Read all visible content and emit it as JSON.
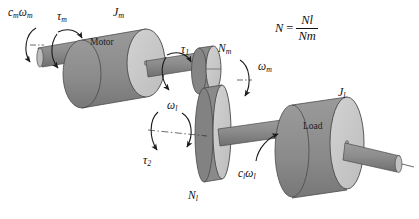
{
  "figure": {
    "background": "#ffffff",
    "stroke": "#1a1a1a"
  },
  "colors": {
    "body_dark": "#8f8f8f",
    "body_shade": "#7e7e7e",
    "face_light": "#c6c6c6",
    "shaft": "#949494",
    "shaft_dark": "#7d7d7d",
    "outline": "#3a3a3a",
    "text": "#111111"
  },
  "parts": {
    "motor": {
      "label": "Motor",
      "inertia": "J",
      "inertia_sub": "m"
    },
    "load": {
      "label": "Load",
      "inertia": "J",
      "inertia_sub": "l"
    },
    "gear_motor": {
      "label": "N",
      "label_sub": "m"
    },
    "gear_load": {
      "label": "N",
      "label_sub": "l"
    }
  },
  "annotations": [
    {
      "name": "motor-damping",
      "text": "c",
      "sub1": "m",
      "text2": "ω",
      "sub2": "m"
    },
    {
      "name": "motor-torque",
      "text": "τ",
      "sub1": "m"
    },
    {
      "name": "gear-torque-1",
      "text": "τ",
      "sub1": "1"
    },
    {
      "name": "gear-torque-2",
      "text": "τ",
      "sub1": "2"
    },
    {
      "name": "motor-speed",
      "text": "ω",
      "sub1": "m"
    },
    {
      "name": "load-speed",
      "text": "ω",
      "sub1": "l"
    },
    {
      "name": "load-damping",
      "text": "c",
      "sub1": "l",
      "text2": "ω",
      "sub2": "l"
    }
  ],
  "labels": {
    "motor_name": "Motor",
    "load_name": "Load",
    "Jm": "J",
    "Jm_sub": "m",
    "Jl": "J",
    "Jl_sub": "l",
    "Nm": "N",
    "Nm_sub": "m",
    "Nl": "N",
    "Nl_sub": "l",
    "tau_m": "τ",
    "tau_m_sub": "m",
    "tau_1": "τ",
    "tau_1_sub": "1",
    "tau_2": "τ",
    "tau_2_sub": "2",
    "omega_m": "ω",
    "omega_m_sub": "m",
    "omega_l": "ω",
    "omega_l_sub": "l",
    "c_m": "c",
    "c_m_sub": "m",
    "cm_omega": "ω",
    "cm_omega_sub": "m",
    "c_l": "c",
    "c_l_sub": "l",
    "cl_omega": "ω",
    "cl_omega_sub": "l"
  },
  "equation": {
    "lhs": "N",
    "eq": "=",
    "numerator": "N",
    "numerator_sub": "l",
    "denominator": "N",
    "denominator_sub": "m"
  }
}
